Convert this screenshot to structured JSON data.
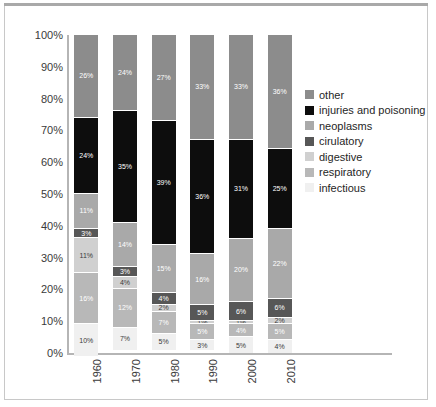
{
  "chart_data": {
    "type": "bar",
    "stacked": true,
    "normalized": "100%",
    "title": "",
    "subtitle": "",
    "xlabel": "",
    "ylabel": "",
    "ylim": [
      0,
      100
    ],
    "grid": false,
    "legend_position": "right",
    "categories": [
      "1960",
      "1970",
      "1980",
      "1990",
      "2000",
      "2010"
    ],
    "ytick_labels": [
      "100%",
      "90%",
      "80%",
      "70%",
      "60%",
      "50%",
      "40%",
      "30%",
      "20%",
      "10%",
      "0%"
    ],
    "ytick_values": [
      100,
      90,
      80,
      70,
      60,
      50,
      40,
      30,
      20,
      10,
      0
    ],
    "stack_order_top_to_bottom": [
      "other",
      "injuries and poisoning",
      "neoplasms",
      "cirulatory",
      "digestive",
      "respiratory",
      "infectious"
    ],
    "series": [
      {
        "name": "other",
        "color": "#8c8c8c",
        "label_color": "#ffffff",
        "values": [
          26,
          24,
          27,
          33,
          33,
          36
        ],
        "labels": [
          "26%",
          "24%",
          "27%",
          "33%",
          "33%",
          "36%"
        ]
      },
      {
        "name": "injuries and poisoning",
        "color": "#0d0d0d",
        "label_color": "#ffffff",
        "values": [
          24,
          35,
          39,
          36,
          31,
          25
        ],
        "labels": [
          "24%",
          "35%",
          "39%",
          "36%",
          "31%",
          "25%"
        ]
      },
      {
        "name": "neoplasms",
        "color": "#a9a9a9",
        "label_color": "#ffffff",
        "values": [
          11,
          14,
          15,
          16,
          20,
          22
        ],
        "labels": [
          "11%",
          "14%",
          "15%",
          "16%",
          "20%",
          "22%"
        ]
      },
      {
        "name": "cirulatory",
        "color": "#575757",
        "label_color": "#ffffff",
        "values": [
          3,
          3,
          4,
          5,
          6,
          6
        ],
        "labels": [
          "3%",
          "3%",
          "4%",
          "5%",
          "6%",
          "6%"
        ]
      },
      {
        "name": "digestive",
        "color": "#d0d0d0",
        "label_color": "#3a3a3a",
        "values": [
          11,
          4,
          2,
          1,
          1,
          2
        ],
        "labels": [
          "11%",
          "4%",
          "2%",
          "1%",
          "1%",
          "2%"
        ]
      },
      {
        "name": "respiratory",
        "color": "#b8b8b8",
        "label_color": "#ffffff",
        "values": [
          16,
          12,
          7,
          5,
          4,
          5
        ],
        "labels": [
          "16%",
          "12%",
          "7%",
          "5%",
          "4%",
          "5%"
        ]
      },
      {
        "name": "infectious",
        "color": "#f0f0f0",
        "label_color": "#3a3a3a",
        "values": [
          10,
          7,
          5,
          3,
          5,
          4
        ],
        "labels": [
          "10%",
          "7%",
          "5%",
          "3%",
          "5%",
          "4%"
        ]
      }
    ],
    "legend": [
      {
        "label": "other",
        "color": "#8c8c8c"
      },
      {
        "label": "injuries and poisoning",
        "color": "#0d0d0d"
      },
      {
        "label": "neoplasms",
        "color": "#a9a9a9"
      },
      {
        "label": "cirulatory",
        "color": "#575757"
      },
      {
        "label": "digestive",
        "color": "#d0d0d0"
      },
      {
        "label": "respiratory",
        "color": "#b8b8b8"
      },
      {
        "label": "infectious",
        "color": "#f0f0f0"
      }
    ]
  }
}
